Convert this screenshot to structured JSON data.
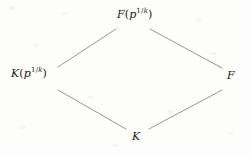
{
  "figure": {
    "name": "field-extension-lattice",
    "type": "hasse-diagram",
    "background_color": "#fdfdfc",
    "edge_color": "#8a8a8a",
    "text_color": "#1b1b1b"
  },
  "nodes": {
    "top": {
      "id": "F-p-1-over-k",
      "base": "F",
      "open_paren": "(",
      "inner_base": "p",
      "exponent_numerator": "1",
      "exponent_slash": "/",
      "exponent_denominator": "k",
      "close_paren": ")",
      "plain": "F(p^{1/k})"
    },
    "left": {
      "id": "K-p-1-over-k",
      "base": "K",
      "open_paren": "(",
      "inner_base": "p",
      "exponent_numerator": "1",
      "exponent_slash": "/",
      "exponent_denominator": "k",
      "close_paren": ")",
      "plain": "K(p^{1/k})"
    },
    "right": {
      "id": "F",
      "base": "F",
      "plain": "F"
    },
    "bottom": {
      "id": "K",
      "base": "K",
      "plain": "K"
    }
  },
  "edges": [
    {
      "id": "edge-left-to-top",
      "from": "left",
      "to": "top",
      "x1": 58,
      "y1": 67,
      "x2": 116,
      "y2": 29
    },
    {
      "id": "edge-top-to-right",
      "from": "top",
      "to": "right",
      "x1": 150,
      "y1": 29,
      "x2": 222,
      "y2": 68
    },
    {
      "id": "edge-left-to-bottom",
      "from": "left",
      "to": "bottom",
      "x1": 58,
      "y1": 90,
      "x2": 126,
      "y2": 129
    },
    {
      "id": "edge-bottom-to-right",
      "from": "bottom",
      "to": "right",
      "x1": 149,
      "y1": 129,
      "x2": 222,
      "y2": 90
    }
  ]
}
